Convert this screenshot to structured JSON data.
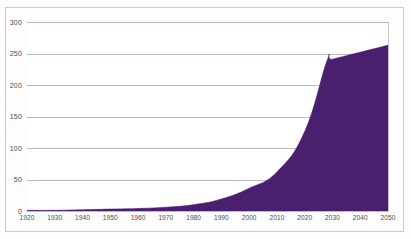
{
  "chart_data": {
    "type": "area",
    "title": "",
    "subtitle": "",
    "xlabel": "",
    "ylabel": "",
    "xlim": [
      1920,
      2050
    ],
    "ylim": [
      0,
      300
    ],
    "grid": true,
    "legend": null,
    "legend_position": "none",
    "series_color": "#4a1f6e",
    "x_tick_labels": [
      "1920",
      "1930",
      "1940",
      "1950",
      "1960",
      "1970",
      "1980",
      "1990",
      "2000",
      "2010",
      "2020",
      "2030",
      "2040",
      "2050"
    ],
    "y_tick_labels": [
      "0",
      "50",
      "100",
      "150",
      "200",
      "250",
      "300"
    ],
    "y_ticks": [
      0,
      50,
      100,
      150,
      200,
      250,
      300
    ],
    "x": [
      1920,
      1930,
      1940,
      1950,
      1960,
      1970,
      1980,
      1990,
      2000,
      2010,
      2020,
      2028,
      2030,
      2040,
      2050
    ],
    "series": [
      {
        "name": "value",
        "values": [
          1,
          1,
          2,
          3,
          4,
          6,
          10,
          19,
          36,
          62,
          126,
          238,
          241,
          252,
          263
        ]
      }
    ]
  },
  "axes": {
    "y": {
      "ticks": [
        {
          "value": 300,
          "label": "300"
        },
        {
          "value": 250,
          "label": "250"
        },
        {
          "value": 200,
          "label": "200"
        },
        {
          "value": 150,
          "label": "150"
        },
        {
          "value": 100,
          "label": "100"
        },
        {
          "value": 50,
          "label": "50"
        },
        {
          "value": 0,
          "label": "0"
        }
      ]
    },
    "x": {
      "ticks": [
        {
          "value": 1920,
          "label": "1920"
        },
        {
          "value": 1930,
          "label": "1930"
        },
        {
          "value": 1940,
          "label": "1940"
        },
        {
          "value": 1950,
          "label": "1950"
        },
        {
          "value": 1960,
          "label": "1960"
        },
        {
          "value": 1970,
          "label": "1970"
        },
        {
          "value": 1980,
          "label": "1980"
        },
        {
          "value": 1990,
          "label": "1990"
        },
        {
          "value": 2000,
          "label": "2000"
        },
        {
          "value": 2010,
          "label": "2010"
        },
        {
          "value": 2020,
          "label": "2020"
        },
        {
          "value": 2030,
          "label": "2030"
        },
        {
          "value": 2040,
          "label": "2040"
        },
        {
          "value": 2050,
          "label": "2050"
        }
      ]
    }
  }
}
